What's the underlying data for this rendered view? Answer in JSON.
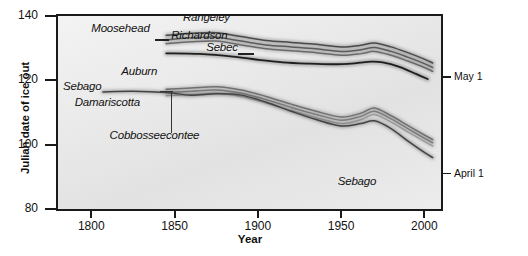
{
  "chart_data": {
    "type": "line",
    "title": "",
    "xlabel": "Year",
    "ylabel": "Julian date of ice out",
    "xlim": [
      1780,
      2010
    ],
    "ylim": [
      80,
      140
    ],
    "grid": false,
    "legend_position": "inline-labels",
    "x_ticks": [
      1800,
      1850,
      1900,
      1950,
      2000
    ],
    "y_ticks": [
      80,
      100,
      120,
      140
    ],
    "secondary_axis": {
      "side": "right",
      "ticks": [
        {
          "value": 121,
          "label": "May 1"
        },
        {
          "value": 91,
          "label": "April 1"
        }
      ]
    },
    "series": [
      {
        "name": "Rangeley",
        "color": "#4a4a4a",
        "x": [
          1845,
          1860,
          1875,
          1890,
          1905,
          1920,
          1935,
          1950,
          1962,
          1970,
          1980,
          1990,
          2000,
          2005
        ],
        "values": [
          134.0,
          134.6,
          134.8,
          133.6,
          132.4,
          131.8,
          131.2,
          130.4,
          130.9,
          131.6,
          130.4,
          128.6,
          126.6,
          125.4
        ]
      },
      {
        "name": "Moosehead",
        "color": "#5a5a5a",
        "x": [
          1845,
          1860,
          1875,
          1890,
          1905,
          1920,
          1935,
          1950,
          1962,
          1970,
          1980,
          1990,
          2000,
          2005
        ],
        "values": [
          132.6,
          133.2,
          133.4,
          132.2,
          131.0,
          130.4,
          129.8,
          129.0,
          129.5,
          130.2,
          129.0,
          127.2,
          125.2,
          124.0
        ]
      },
      {
        "name": "Richardson",
        "color": "#6a6a6a",
        "x": [
          1845,
          1860,
          1875,
          1890,
          1905,
          1920,
          1935,
          1950,
          1962,
          1970,
          1980,
          1990,
          2000,
          2005
        ],
        "values": [
          131.4,
          132.0,
          132.2,
          131.0,
          129.8,
          129.2,
          128.6,
          127.8,
          128.3,
          129.0,
          127.8,
          126.0,
          124.0,
          122.8
        ]
      },
      {
        "name": "Sebec",
        "color": "#1f1f1f",
        "x": [
          1845,
          1865,
          1885,
          1900,
          1915,
          1930,
          1945,
          1958,
          1968,
          1975,
          1985,
          1995,
          2002
        ],
        "values": [
          128.4,
          128.2,
          127.4,
          126.4,
          125.6,
          125.2,
          125.0,
          125.3,
          125.8,
          125.6,
          124.2,
          122.0,
          120.4
        ]
      },
      {
        "name": "Auburn",
        "color": "#707070",
        "x": [
          1845,
          1860,
          1875,
          1890,
          1905,
          1920,
          1935,
          1950,
          1962,
          1970,
          1980,
          1990,
          2000,
          2005
        ],
        "values": [
          117.2,
          117.6,
          118.0,
          117.0,
          115.0,
          112.6,
          110.4,
          108.6,
          109.8,
          111.4,
          109.0,
          106.0,
          103.0,
          101.6
        ]
      },
      {
        "name": "Cobbosseecontee",
        "color": "#7a7a7a",
        "x": [
          1845,
          1860,
          1875,
          1890,
          1905,
          1920,
          1935,
          1950,
          1962,
          1970,
          1980,
          1990,
          2000,
          2005
        ],
        "values": [
          116.2,
          116.6,
          117.0,
          116.0,
          114.0,
          111.6,
          109.4,
          107.6,
          108.8,
          110.4,
          108.0,
          105.0,
          102.0,
          100.6
        ]
      },
      {
        "name": "Damariscotta",
        "color": "#9a9a9a",
        "x": [
          1845,
          1860,
          1875,
          1890,
          1905,
          1920,
          1935,
          1950,
          1962,
          1970,
          1980,
          1990,
          2000,
          2005
        ],
        "values": [
          115.2,
          115.6,
          116.0,
          115.0,
          113.0,
          110.6,
          108.4,
          106.6,
          107.8,
          109.4,
          107.0,
          104.0,
          101.0,
          99.6
        ]
      },
      {
        "name": "Sebago",
        "color": "#444444",
        "x": [
          1807,
          1825,
          1845,
          1860,
          1875,
          1890,
          1905,
          1920,
          1935,
          1950,
          1962,
          1970,
          1980,
          1990,
          2000,
          2005
        ],
        "values": [
          116.4,
          116.6,
          116.2,
          115.4,
          115.8,
          115.4,
          113.2,
          110.4,
          107.8,
          105.8,
          106.6,
          107.4,
          105.0,
          101.2,
          97.6,
          96.0
        ]
      }
    ],
    "annotations": [
      {
        "text": "Rangeley",
        "x": 1855,
        "y": 139.0,
        "align": "left"
      },
      {
        "text": "Moosehead",
        "x": 1800,
        "y": 135.5,
        "align": "left"
      },
      {
        "text": "Richardson",
        "x": 1848,
        "y": 133.5,
        "align": "left"
      },
      {
        "text": "Sebec",
        "x": 1869,
        "y": 129.8,
        "align": "left"
      },
      {
        "text": "Auburn",
        "x": 1818,
        "y": 122.2,
        "align": "left"
      },
      {
        "text": "Sebago",
        "x": 1783,
        "y": 117.6,
        "align": "left"
      },
      {
        "text": "Damariscotta",
        "x": 1790,
        "y": 112.5,
        "align": "left"
      },
      {
        "text": "Cobbosseecontee",
        "x": 1811,
        "y": 102.5,
        "align": "left"
      },
      {
        "text": "Sebago",
        "x": 1948,
        "y": 88.0,
        "align": "left"
      }
    ]
  },
  "axes": {
    "y_title": "Julian date of ice out",
    "x_title": "Year",
    "y_tick_labels": [
      "140",
      "120",
      "100",
      "80"
    ],
    "x_tick_labels": [
      "1800",
      "1850",
      "1900",
      "1950",
      "2000"
    ],
    "right_tick_labels": [
      "May 1",
      "April 1"
    ]
  },
  "colors": {
    "axis": "#1a1a1a",
    "plot_background_light": "#f3f3f3",
    "plot_background_dark": "#e2e2e2",
    "text": "#111111"
  }
}
